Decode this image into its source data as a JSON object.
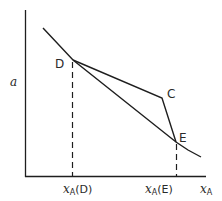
{
  "diagram": {
    "axes": {
      "y_label": "a",
      "x_label_main": "x",
      "x_label_sub": "A"
    },
    "points": [
      {
        "name": "D",
        "label": "D"
      },
      {
        "name": "C",
        "label": "C"
      },
      {
        "name": "E",
        "label": "E"
      }
    ],
    "ticks": [
      {
        "main": "x",
        "sub": "A",
        "suffix": "(D)"
      },
      {
        "main": "x",
        "sub": "A",
        "suffix": "(E)"
      }
    ],
    "colors": {
      "ink": "#1e1e1e",
      "background": "#ffffff"
    }
  }
}
